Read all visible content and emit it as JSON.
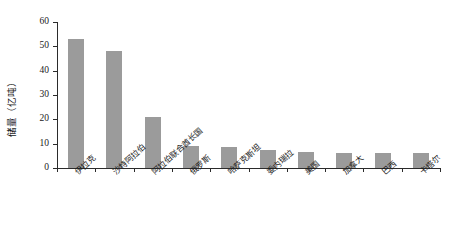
{
  "chart_data": {
    "type": "bar",
    "title": "",
    "subtitle": "",
    "xlabel": "",
    "ylabel": "储量（亿吨）",
    "ylim": [
      0,
      60
    ],
    "ytick_values": [
      0,
      10,
      20,
      30,
      40,
      50,
      60
    ],
    "ytick_labels": [
      "0",
      "10",
      "20",
      "30",
      "40",
      "50",
      "60"
    ],
    "grid": false,
    "legend": false,
    "legend_position": "none",
    "bar_color": "#9b9b9b",
    "axis_color": "#2b2b2b",
    "categories": [
      "伊拉克",
      "沙特阿拉伯",
      "阿拉伯联合酋长国",
      "俄罗斯",
      "哈萨克斯坦",
      "委内瑞拉",
      "美国",
      "加拿大",
      "巴西",
      "卡塔尔"
    ],
    "values": [
      53,
      48,
      21,
      9,
      8.5,
      7.5,
      6.5,
      6.3,
      6,
      6
    ]
  }
}
